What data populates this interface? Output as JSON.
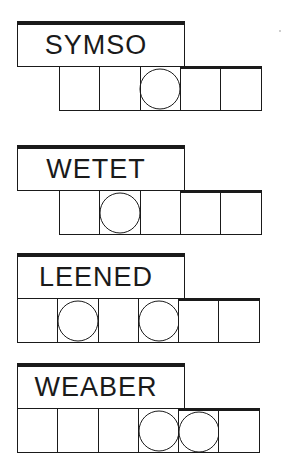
{
  "puzzles": [
    {
      "scrambled": "SYMSO",
      "answer_length": 5,
      "cells_start_x": 59,
      "circled": [
        3
      ],
      "top": 21
    },
    {
      "scrambled": "WETET",
      "answer_length": 5,
      "cells_start_x": 59,
      "circled": [
        2
      ],
      "top": 145
    },
    {
      "scrambled": "LEENED",
      "answer_length": 6,
      "cells_start_x": 17,
      "circled": [
        2,
        4
      ],
      "top": 253
    },
    {
      "scrambled": "WEABER",
      "answer_length": 6,
      "cells_start_x": 17,
      "circled": [
        4,
        5
      ],
      "top": 363
    }
  ],
  "colors": {
    "ink": "#1a1a1a",
    "background": "#ffffff"
  }
}
